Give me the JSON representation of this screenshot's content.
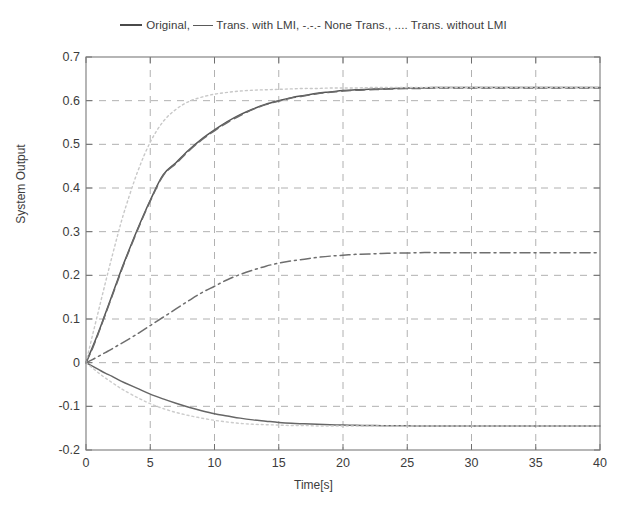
{
  "figure": {
    "background": "#ffffff",
    "axis_color": "#7a7a7a",
    "grid_color": "#9a9a9a",
    "text_color": "#3c3c3c"
  },
  "legend": {
    "full_text": "___ Original, ---- Trans. with LMI, -.-.- None Trans., .... Trans. without LMI",
    "part_1": "Original,",
    "part_2": "Trans. with LMI,",
    "part_3": "-.-.- None Trans., .... Trans. without LMI"
  },
  "axes": {
    "ylabel": "System Output",
    "xlabel": "Time[s]",
    "xticks": [
      "0",
      "5",
      "10",
      "15",
      "20",
      "25",
      "30",
      "35",
      "40"
    ],
    "yticks": [
      "0.7",
      "0.6",
      "0.5",
      "0.4",
      "0.3",
      "0.2",
      "0.1",
      "0",
      "-0.1",
      "-0.2"
    ]
  },
  "chart_data": {
    "type": "line",
    "title": "",
    "subtitle": "",
    "xlabel": "Time[s]",
    "ylabel": "System Output",
    "xlim": [
      0,
      40
    ],
    "ylim": [
      -0.2,
      0.7
    ],
    "xticks": [
      0,
      5,
      10,
      15,
      20,
      25,
      30,
      35,
      40
    ],
    "yticks": [
      -0.2,
      -0.1,
      0,
      0.1,
      0.2,
      0.3,
      0.4,
      0.5,
      0.6,
      0.7
    ],
    "grid": true,
    "legend_position": "above-axes",
    "annotations": [],
    "x": [
      0,
      0.5,
      1,
      1.5,
      2,
      2.5,
      3,
      4,
      5,
      6,
      7,
      8,
      9,
      10,
      11,
      12,
      13,
      14,
      15,
      16,
      17,
      18,
      19,
      20,
      21,
      22,
      23,
      24,
      25,
      26,
      27,
      28,
      30,
      32,
      34,
      36,
      38,
      40
    ],
    "series": [
      {
        "name": "Original",
        "style": "solid",
        "color": "#555555",
        "steady_state": 0.63,
        "values": [
          0,
          0.035,
          0.072,
          0.112,
          0.152,
          0.193,
          0.232,
          0.305,
          0.372,
          0.43,
          0.458,
          0.487,
          0.512,
          0.533,
          0.552,
          0.568,
          0.581,
          0.592,
          0.6,
          0.607,
          0.612,
          0.617,
          0.62,
          0.623,
          0.625,
          0.626,
          0.627,
          0.628,
          0.629,
          0.629,
          0.63,
          0.63,
          0.63,
          0.63,
          0.63,
          0.63,
          0.63,
          0.63
        ]
      },
      {
        "name": "Trans. with LMI",
        "style": "dashed",
        "color": "#6a6a6a",
        "steady_state": 0.63,
        "values": [
          0,
          0.032,
          0.07,
          0.11,
          0.15,
          0.19,
          0.23,
          0.303,
          0.37,
          0.428,
          0.456,
          0.485,
          0.51,
          0.531,
          0.55,
          0.566,
          0.58,
          0.591,
          0.599,
          0.606,
          0.611,
          0.616,
          0.619,
          0.622,
          0.624,
          0.625,
          0.626,
          0.627,
          0.628,
          0.628,
          0.629,
          0.629,
          0.629,
          0.629,
          0.629,
          0.629,
          0.629,
          0.629
        ]
      },
      {
        "name": "None Trans.",
        "style": "dashdot",
        "color": "#6e6e6e",
        "steady_state": 0.252,
        "values": [
          0,
          0.007,
          0.015,
          0.023,
          0.031,
          0.04,
          0.048,
          0.066,
          0.085,
          0.104,
          0.123,
          0.142,
          0.16,
          0.175,
          0.19,
          0.202,
          0.212,
          0.221,
          0.228,
          0.233,
          0.237,
          0.241,
          0.244,
          0.246,
          0.248,
          0.249,
          0.25,
          0.251,
          0.251,
          0.252,
          0.252,
          0.252,
          0.252,
          0.252,
          0.252,
          0.252,
          0.252,
          0.252
        ]
      },
      {
        "name": "Trans. without LMI",
        "style": "dotted",
        "color": "#c8c8c8",
        "steady_state": 0.63,
        "values": [
          0,
          0.062,
          0.122,
          0.182,
          0.24,
          0.296,
          0.348,
          0.436,
          0.505,
          0.552,
          0.58,
          0.598,
          0.608,
          0.615,
          0.619,
          0.622,
          0.624,
          0.625,
          0.626,
          0.627,
          0.628,
          0.628,
          0.629,
          0.629,
          0.629,
          0.63,
          0.63,
          0.63,
          0.63,
          0.63,
          0.63,
          0.63,
          0.63,
          0.63,
          0.63,
          0.63,
          0.63,
          0.63
        ]
      },
      {
        "name": "Negative response",
        "style": "solid",
        "color": "#666666",
        "steady_state": -0.145,
        "values": [
          0,
          -0.008,
          -0.016,
          -0.024,
          -0.031,
          -0.039,
          -0.046,
          -0.059,
          -0.072,
          -0.083,
          -0.093,
          -0.102,
          -0.11,
          -0.117,
          -0.122,
          -0.127,
          -0.131,
          -0.134,
          -0.137,
          -0.139,
          -0.14,
          -0.141,
          -0.142,
          -0.143,
          -0.1435,
          -0.144,
          -0.1443,
          -0.1445,
          -0.1447,
          -0.1448,
          -0.1449,
          -0.145,
          -0.145,
          -0.145,
          -0.145,
          -0.145,
          -0.145,
          -0.145
        ]
      },
      {
        "name": "Negative response (dotted variant)",
        "style": "dotted",
        "color": "#cccccc",
        "steady_state": -0.145,
        "values": [
          0,
          -0.012,
          -0.024,
          -0.035,
          -0.045,
          -0.055,
          -0.064,
          -0.08,
          -0.094,
          -0.105,
          -0.114,
          -0.121,
          -0.127,
          -0.132,
          -0.136,
          -0.139,
          -0.141,
          -0.142,
          -0.143,
          -0.144,
          -0.144,
          -0.145,
          -0.145,
          -0.145,
          -0.145,
          -0.145,
          -0.145,
          -0.145,
          -0.145,
          -0.145,
          -0.145,
          -0.145,
          -0.145,
          -0.145,
          -0.145,
          -0.145,
          -0.145,
          -0.145
        ]
      }
    ]
  }
}
